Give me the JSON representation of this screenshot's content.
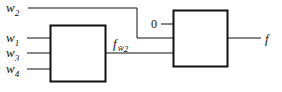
{
  "diagram": {
    "inputs": {
      "w2": {
        "base": "w",
        "sub": "2"
      },
      "w1": {
        "base": "w",
        "sub": "1"
      },
      "w3": {
        "base": "w",
        "sub": "3"
      },
      "w4": {
        "base": "w",
        "sub": "4"
      }
    },
    "intermediate": {
      "base": "f",
      "sub": "w̄",
      "subsub": "2"
    },
    "constant": "0",
    "output": "f",
    "colors": {
      "stroke": "#111111",
      "background": "#ffffff"
    }
  }
}
